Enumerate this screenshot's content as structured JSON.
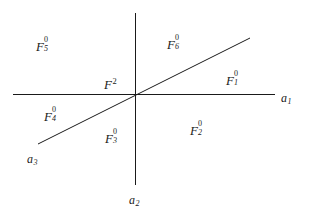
{
  "figure": {
    "background_color": "#ffffff",
    "line_color": "#1a1a1a",
    "text_color": "#1a1a1a",
    "width": 310,
    "height": 214
  },
  "axes": {
    "horizontal": {
      "name": "a1",
      "label_base": "a",
      "label_sub": "1",
      "x1": 13,
      "y1": 94,
      "x2": 275,
      "y2": 94,
      "label_x": 281,
      "label_y": 89
    },
    "vertical": {
      "name": "a2",
      "label_base": "a",
      "label_sub": "2",
      "x1": 135,
      "y1": 13,
      "x2": 135,
      "y2": 185,
      "label_x": 129,
      "label_y": 191
    },
    "diagonal": {
      "name": "a3",
      "label_base": "a",
      "label_sub": "3",
      "x1": 38,
      "y1": 144,
      "x2": 250,
      "y2": 38,
      "label_x": 27,
      "label_y": 150
    }
  },
  "regions": [
    {
      "id": "F5",
      "base": "F",
      "sub": "5",
      "sup": "0",
      "x": 36,
      "y": 38
    },
    {
      "id": "F6",
      "base": "F",
      "sub": "6",
      "sup": "0",
      "x": 167,
      "y": 36
    },
    {
      "id": "F1",
      "base": "F",
      "sub": "1",
      "sup": "0",
      "x": 226,
      "y": 72
    },
    {
      "id": "F2c",
      "base": "F",
      "sub": "",
      "sup": "2",
      "x": 104,
      "y": 76
    },
    {
      "id": "F4",
      "base": "F",
      "sub": "4",
      "sup": "0",
      "x": 44,
      "y": 108
    },
    {
      "id": "F3",
      "base": "F",
      "sub": "3",
      "sup": "0",
      "x": 105,
      "y": 130
    },
    {
      "id": "F2",
      "base": "F",
      "sub": "2",
      "sup": "0",
      "x": 190,
      "y": 122
    }
  ]
}
